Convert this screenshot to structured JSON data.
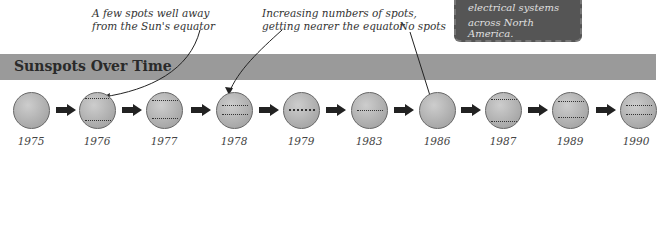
{
  "header": {
    "title": "Sunspots Over Time"
  },
  "callout": {
    "line1": "electrical systems",
    "line2": "across North America."
  },
  "annotations": [
    {
      "line1": "A few spots well away",
      "line2": "from the Sun's equator"
    },
    {
      "line1": "Increasing numbers of spots,",
      "line2": "getting nearer the equator"
    },
    {
      "line1": "No spots"
    }
  ],
  "timeline": [
    {
      "year": "1975",
      "spots": "none"
    },
    {
      "year": "1976",
      "spots": "few-far"
    },
    {
      "year": "1977",
      "spots": "few-far"
    },
    {
      "year": "1978",
      "spots": "many-near"
    },
    {
      "year": "1979",
      "spots": "equator"
    },
    {
      "year": "1983",
      "spots": "equator"
    },
    {
      "year": "1986",
      "spots": "none"
    },
    {
      "year": "1987",
      "spots": "few-far"
    },
    {
      "year": "1989",
      "spots": "few-far"
    },
    {
      "year": "1990",
      "spots": "many-near"
    }
  ],
  "colors": {
    "band": "#9a9a9a",
    "sun": "#b8b8b8",
    "arrow": "#222222",
    "callout": "#555555"
  }
}
